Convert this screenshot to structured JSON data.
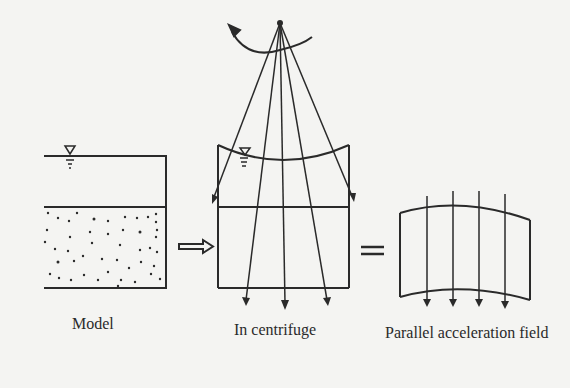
{
  "figure": {
    "panels": [
      {
        "id": "model",
        "label": "Model"
      },
      {
        "id": "centrifuge",
        "label": "In centrifuge"
      },
      {
        "id": "parallel",
        "label": "Parallel acceleration field"
      }
    ],
    "connectors": {
      "arrow": "hollow-right-arrow",
      "equals": "equals-sign"
    },
    "colors": {
      "ink": "#2a2a2a",
      "background": "#f4f4f2"
    }
  }
}
